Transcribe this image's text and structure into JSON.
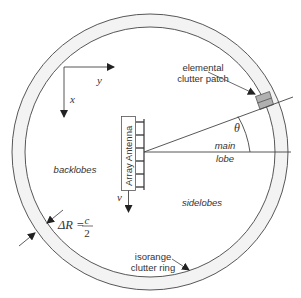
{
  "diagram": {
    "type": "radar clutter geometry",
    "colors": {
      "stroke": "#444444",
      "ring_fill": "#f3f3f3",
      "patch_fill": "#b0b0b0",
      "text": "#333333"
    },
    "axes": {
      "y_label": "y",
      "x_label": "x"
    },
    "antenna": {
      "label": "Array Antenna",
      "element_count": 6,
      "velocity_label": "v"
    },
    "labels": {
      "patch_line1": "elemental",
      "patch_line2": "clutter patch",
      "theta": "θ",
      "main_lobe_line1": "main",
      "main_lobe_line2": "lobe",
      "backlobes": "backlobes",
      "sidelobes": "sidelobes",
      "ring_line1": "isorange",
      "ring_line2": "clutter ring"
    },
    "equation": {
      "lhs": "ΔR =",
      "numerator": "c",
      "denominator": "2"
    }
  }
}
